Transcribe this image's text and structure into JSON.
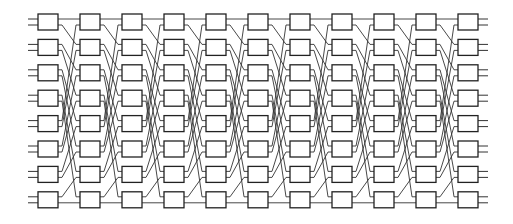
{
  "diagram": {
    "type": "shuffle-exchange network",
    "wires": 16,
    "columns": 11,
    "boxes_per_column": 8,
    "box_inputs": 2,
    "box_outputs": 2,
    "interconnect": "perfect-shuffle",
    "colors": {
      "background": "#ffffff",
      "line": "#333333",
      "box_stroke": "#222222"
    },
    "geometry": {
      "first_box_x": 38,
      "column_pitch": 42,
      "box_width": 20,
      "first_box_y": 14,
      "row_pitch": 25.4,
      "box_height": 16,
      "port_offset": 5,
      "stub_length": 10
    }
  }
}
